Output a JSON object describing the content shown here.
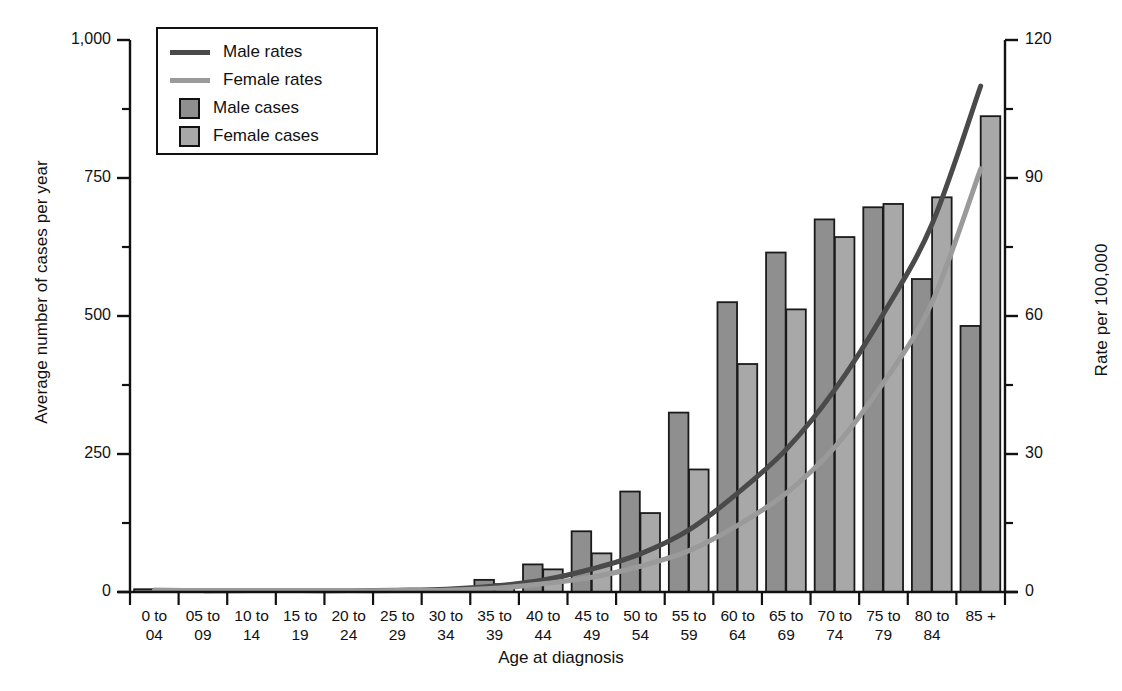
{
  "chart_data": {
    "type": "bar",
    "title": "",
    "xlabel": "Age at diagnosis",
    "ylabel": "Average number of cases per year",
    "ylabel_right": "Rate per 100,000",
    "categories": [
      "0 to\n04",
      "05 to\n09",
      "10 to\n14",
      "15 to\n19",
      "20 to\n24",
      "25 to\n29",
      "30 to\n34",
      "35 to\n39",
      "40 to\n44",
      "45 to\n49",
      "50 to\n54",
      "55 to\n59",
      "60 to\n64",
      "65 to\n69",
      "70 to\n74",
      "75 to\n79",
      "80 to\n84",
      "85 +"
    ],
    "category_lines": [
      [
        "0 to",
        "04"
      ],
      [
        "05 to",
        "09"
      ],
      [
        "10 to",
        "14"
      ],
      [
        "15 to",
        "19"
      ],
      [
        "20 to",
        "24"
      ],
      [
        "25 to",
        "29"
      ],
      [
        "30 to",
        "34"
      ],
      [
        "35 to",
        "39"
      ],
      [
        "40 to",
        "44"
      ],
      [
        "45 to",
        "49"
      ],
      [
        "50 to",
        "54"
      ],
      [
        "55 to",
        "59"
      ],
      [
        "60 to",
        "64"
      ],
      [
        "65 to",
        "69"
      ],
      [
        "70 to",
        "74"
      ],
      [
        "75 to",
        "79"
      ],
      [
        "80 to",
        "84"
      ],
      [
        "85 +",
        ""
      ]
    ],
    "series": [
      {
        "name": "Male cases",
        "axis": "left",
        "type": "bar",
        "color": "#8f8f8f",
        "values": [
          5,
          4,
          4,
          4,
          4,
          5,
          5,
          22,
          50,
          110,
          182,
          325,
          525,
          615,
          675,
          697,
          567,
          482
        ]
      },
      {
        "name": "Female cases",
        "axis": "left",
        "type": "bar",
        "color": "#a8a8a8",
        "values": [
          4,
          4,
          4,
          4,
          4,
          4,
          5,
          14,
          41,
          70,
          143,
          222,
          413,
          512,
          643,
          703,
          715,
          862
        ]
      },
      {
        "name": "Male rates",
        "axis": "right",
        "type": "line",
        "color": "#4a4a4a",
        "values": [
          0.4,
          0.3,
          0.3,
          0.3,
          0.3,
          0.4,
          0.6,
          1.3,
          2.6,
          5.0,
          8.3,
          13.5,
          21.5,
          31.0,
          44.0,
          60.5,
          80.0,
          110.0
        ]
      },
      {
        "name": "Female rates",
        "axis": "right",
        "type": "line",
        "color": "#9a9a9a",
        "values": [
          0.3,
          0.3,
          0.3,
          0.3,
          0.3,
          0.3,
          0.4,
          0.8,
          1.8,
          3.2,
          5.6,
          9.0,
          14.5,
          21.5,
          31.5,
          45.5,
          63.0,
          92.0
        ]
      }
    ],
    "yticks_left": [
      "0",
      "250",
      "500",
      "750",
      "1,000"
    ],
    "yticks_left_values": [
      0,
      250,
      500,
      750,
      1000
    ],
    "ylim_left": [
      0,
      1000
    ],
    "yticks_right": [
      "0",
      "30",
      "60",
      "90",
      "120"
    ],
    "yticks_right_values": [
      0,
      30,
      60,
      90,
      120
    ],
    "ylim_right": [
      0,
      120
    ],
    "minor_ticks_left": [
      125,
      375,
      625,
      875
    ],
    "minor_ticks_right": [
      15,
      45,
      75,
      105
    ],
    "grid": false,
    "legend_position": "top-left"
  },
  "legend": {
    "entries": [
      {
        "label": "Male rates",
        "marker": "line",
        "color": "#4a4a4a"
      },
      {
        "label": "Female rates",
        "marker": "line",
        "color": "#9a9a9a"
      },
      {
        "label": "Male cases",
        "marker": "swatch",
        "color": "#8f8f8f"
      },
      {
        "label": "Female cases",
        "marker": "swatch",
        "color": "#a8a8a8"
      }
    ]
  }
}
